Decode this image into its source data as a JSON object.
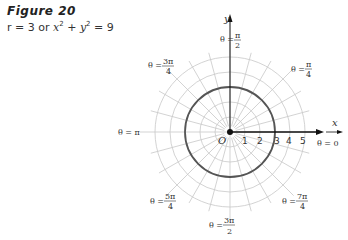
{
  "figure": {
    "title": "Figure 20",
    "caption_parts": {
      "r_eq": "r = 3 or ",
      "x": "x",
      "plus": " + ",
      "y": "y",
      "sup": "2",
      "eq9": " = 9"
    }
  },
  "chart_data": {
    "type": "polar",
    "title": "Figure 20",
    "subtitle": "r = 3 or x² + y² = 9",
    "curve": {
      "r": 3,
      "description": "circle of radius 3 centered at origin"
    },
    "radial_ticks": [
      "1",
      "2",
      "3",
      "4",
      "5"
    ],
    "radial_range": [
      0,
      5
    ],
    "angular_gridlines_deg": 15,
    "axis_labels": {
      "x": "x",
      "y": "y",
      "origin": "O"
    },
    "angle_labels": [
      {
        "angle": "0",
        "text": "θ = 0"
      },
      {
        "angle": "π/4",
        "text": "θ = π/4"
      },
      {
        "angle": "π/2",
        "text": "θ = π/2"
      },
      {
        "angle": "3π/4",
        "text": "θ = 3π/4"
      },
      {
        "angle": "π",
        "text": "θ = π"
      },
      {
        "angle": "5π/4",
        "text": "θ = 5π/4"
      },
      {
        "angle": "3π/2",
        "text": "θ = 3π/2"
      },
      {
        "angle": "7π/4",
        "text": "θ = 7π/4"
      }
    ],
    "grid": true
  },
  "labels": {
    "theta_eq": "θ =",
    "pi": "π",
    "n1": "1",
    "n2": "2",
    "n3": "3",
    "n4": "4",
    "n5": "5",
    "x": "x",
    "y": "y",
    "O": "O",
    "theta0": "θ = 0",
    "thetaPi": "θ = π",
    "num_pi": "π",
    "num_3pi": "3π",
    "num_5pi": "5π",
    "num_7pi": "7π",
    "den2": "2",
    "den4": "4"
  },
  "colors": {
    "grid": "#c8c8c8",
    "curve": "#555555",
    "axis": "#111111"
  }
}
